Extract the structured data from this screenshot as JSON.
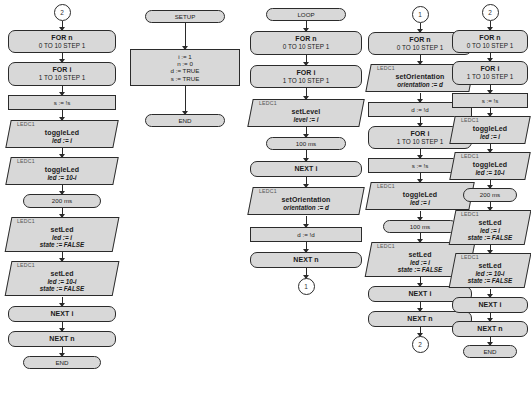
{
  "diagram": {
    "colors": {
      "node_fill": "#d8d8d8",
      "node_border": "#2b2b2b",
      "page": "#ffffff",
      "tag_text": "#555555"
    },
    "columns": [
      {
        "id": "column-1",
        "nodes": [
          {
            "kind": "connector-ref",
            "label": "2"
          },
          {
            "kind": "loop-head",
            "lines": [
              "FOR n",
              "0 TO 10 STEP 1"
            ]
          },
          {
            "kind": "loop-head",
            "lines": [
              "FOR i",
              "1 TO 10 STEP 1"
            ]
          },
          {
            "kind": "assign",
            "lines": [
              "s := !s"
            ]
          },
          {
            "kind": "device-call",
            "tag": "LEDC1",
            "title": "toggleLed",
            "lines": [
              "led := i"
            ]
          },
          {
            "kind": "device-call",
            "tag": "LEDC1",
            "title": "toggleLed",
            "lines": [
              "led := 10-i"
            ]
          },
          {
            "kind": "delay",
            "lines": [
              "200 ms"
            ]
          },
          {
            "kind": "device-call",
            "tag": "LEDC1",
            "title": "setLed",
            "lines": [
              "led := i",
              "state := FALSE"
            ]
          },
          {
            "kind": "device-call",
            "tag": "LEDC1",
            "title": "setLed",
            "lines": [
              "led := 10-i",
              "state := FALSE"
            ]
          },
          {
            "kind": "loop-end",
            "lines": [
              "NEXT i"
            ]
          },
          {
            "kind": "loop-end",
            "lines": [
              "NEXT n"
            ]
          },
          {
            "kind": "terminal",
            "lines": [
              "END"
            ]
          }
        ]
      },
      {
        "id": "column-2",
        "nodes": [
          {
            "kind": "terminal",
            "lines": [
              "SETUP"
            ]
          },
          {
            "kind": "assign-multi",
            "lines": [
              "i := 1",
              "n := 0",
              "d := TRUE",
              "s := TRUE"
            ]
          },
          {
            "kind": "terminal",
            "lines": [
              "END"
            ]
          }
        ]
      },
      {
        "id": "column-3",
        "nodes": [
          {
            "kind": "terminal",
            "lines": [
              "LOOP"
            ]
          },
          {
            "kind": "loop-head",
            "lines": [
              "FOR n",
              "0 TO 10 STEP 1"
            ]
          },
          {
            "kind": "loop-head",
            "lines": [
              "FOR i",
              "1 TO 10 STEP 1"
            ]
          },
          {
            "kind": "device-call",
            "tag": "LEDC1",
            "title": "setLevel",
            "lines": [
              "level := i"
            ]
          },
          {
            "kind": "delay",
            "lines": [
              "100 ms"
            ]
          },
          {
            "kind": "loop-end",
            "lines": [
              "NEXT i"
            ]
          },
          {
            "kind": "device-call",
            "tag": "LEDC1",
            "title": "setOrientation",
            "lines": [
              "orientation := d"
            ]
          },
          {
            "kind": "assign",
            "lines": [
              "d := !d"
            ]
          },
          {
            "kind": "loop-end",
            "lines": [
              "NEXT n"
            ]
          },
          {
            "kind": "connector-ref",
            "label": "1"
          }
        ]
      },
      {
        "id": "column-4",
        "nodes": [
          {
            "kind": "connector-ref",
            "label": "1"
          },
          {
            "kind": "loop-head",
            "lines": [
              "FOR n",
              "0 TO 10 STEP 1"
            ]
          },
          {
            "kind": "device-call",
            "tag": "LEDC1",
            "title": "setOrientation",
            "lines": [
              "orientation := d"
            ]
          },
          {
            "kind": "assign",
            "lines": [
              "d := !d"
            ]
          },
          {
            "kind": "loop-head",
            "lines": [
              "FOR i",
              "1 TO 10 STEP 1"
            ]
          },
          {
            "kind": "assign",
            "lines": [
              "s := !s"
            ]
          },
          {
            "kind": "device-call",
            "tag": "LEDC1",
            "title": "toggleLed",
            "lines": [
              "led := i"
            ]
          },
          {
            "kind": "delay",
            "lines": [
              "100 ms"
            ]
          },
          {
            "kind": "device-call",
            "tag": "LEDC1",
            "title": "setLed",
            "lines": [
              "led := i",
              "state := FALSE"
            ]
          },
          {
            "kind": "loop-end",
            "lines": [
              "NEXT i"
            ]
          },
          {
            "kind": "loop-end",
            "lines": [
              "NEXT n"
            ]
          },
          {
            "kind": "connector-ref",
            "label": "2"
          }
        ]
      },
      {
        "id": "column-5",
        "nodes": [
          {
            "kind": "connector-ref",
            "label": "2"
          },
          {
            "kind": "loop-head",
            "lines": [
              "FOR n",
              "0 TO 10 STEP 1"
            ]
          },
          {
            "kind": "loop-head",
            "lines": [
              "FOR i",
              "1 TO 10 STEP 1"
            ]
          },
          {
            "kind": "assign",
            "lines": [
              "s := !s"
            ]
          },
          {
            "kind": "device-call",
            "tag": "LEDC1",
            "title": "toggleLed",
            "lines": [
              "led := i"
            ]
          },
          {
            "kind": "device-call",
            "tag": "LEDC1",
            "title": "toggleLed",
            "lines": [
              "led := 10-i"
            ]
          },
          {
            "kind": "delay",
            "lines": [
              "200 ms"
            ]
          },
          {
            "kind": "device-call",
            "tag": "LEDC1",
            "title": "setLed",
            "lines": [
              "led := i",
              "state := FALSE"
            ]
          },
          {
            "kind": "device-call",
            "tag": "LEDC1",
            "title": "setLed",
            "lines": [
              "led := 10-i",
              "state := FALSE"
            ]
          },
          {
            "kind": "loop-end",
            "lines": [
              "NEXT i"
            ]
          },
          {
            "kind": "loop-end",
            "lines": [
              "NEXT n"
            ]
          },
          {
            "kind": "terminal",
            "lines": [
              "END"
            ]
          }
        ]
      }
    ]
  }
}
